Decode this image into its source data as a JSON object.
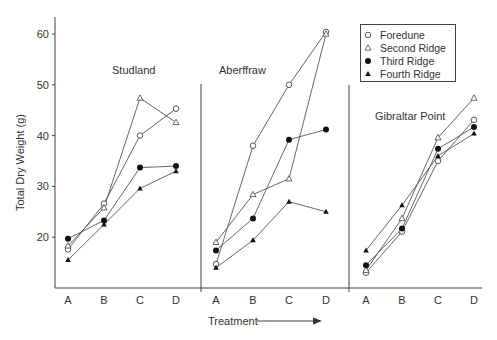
{
  "chart_data": {
    "type": "line",
    "title": "",
    "xlabel": "Treatment",
    "ylabel": "Total Dry Weight (g)",
    "ylim": [
      10,
      63
    ],
    "yticks": [
      20,
      30,
      40,
      50,
      60
    ],
    "categories": [
      "A",
      "B",
      "C",
      "D"
    ],
    "grid": false,
    "legend_position": "top-right",
    "legend": [
      {
        "name": "Foredune",
        "marker": "open-circle"
      },
      {
        "name": "Second Ridge",
        "marker": "open-triangle"
      },
      {
        "name": "Third Ridge",
        "marker": "filled-circle"
      },
      {
        "name": "Fourth Ridge",
        "marker": "filled-triangle"
      }
    ],
    "panels": [
      {
        "name": "Studland",
        "series": [
          {
            "name": "Foredune",
            "values": [
              17.6,
              26.6,
              40.0,
              45.3
            ]
          },
          {
            "name": "Second Ridge",
            "values": [
              18.3,
              25.8,
              47.4,
              42.6
            ]
          },
          {
            "name": "Third Ridge",
            "values": [
              19.7,
              23.3,
              33.7,
              34.0
            ]
          },
          {
            "name": "Fourth Ridge",
            "values": [
              15.5,
              22.5,
              29.6,
              33.0
            ]
          }
        ]
      },
      {
        "name": "Aberffraw",
        "series": [
          {
            "name": "Foredune",
            "values": [
              14.7,
              38.0,
              50.0,
              60.4
            ]
          },
          {
            "name": "Second Ridge",
            "values": [
              19.0,
              28.4,
              31.5,
              60.0
            ]
          },
          {
            "name": "Third Ridge",
            "values": [
              17.4,
              23.7,
              39.2,
              41.2
            ]
          },
          {
            "name": "Fourth Ridge",
            "values": [
              14.0,
              19.4,
              27.0,
              25.0
            ]
          }
        ]
      },
      {
        "name": "Gibraltar Point",
        "series": [
          {
            "name": "Foredune",
            "values": [
              13.0,
              21.1,
              35.0,
              43.1
            ]
          },
          {
            "name": "Second Ridge",
            "values": [
              13.5,
              23.7,
              39.6,
              47.4
            ]
          },
          {
            "name": "Third Ridge",
            "values": [
              14.5,
              21.7,
              37.4,
              41.7
            ]
          },
          {
            "name": "Fourth Ridge",
            "values": [
              17.4,
              26.3,
              36.0,
              40.4
            ]
          }
        ]
      }
    ]
  }
}
